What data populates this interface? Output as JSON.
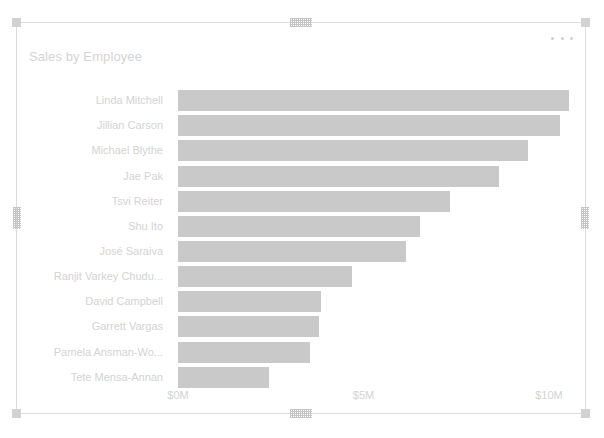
{
  "visual": {
    "title": "Sales by Employee",
    "more_options_label": "More options",
    "frame": {
      "border_color": "#dcdcdc",
      "handle_color": "#d2d2d2"
    }
  },
  "chart_data": {
    "type": "bar",
    "orientation": "horizontal",
    "title": "Sales by Employee",
    "xlabel": "",
    "ylabel": "",
    "grid": false,
    "legend": false,
    "xlim": [
      0,
      10.7
    ],
    "x_tick_values": [
      0,
      5,
      10
    ],
    "x_tick_labels": [
      "$0M",
      "$5M",
      "$10M"
    ],
    "bar_color": "#c9c9c9",
    "value_unit": "millions USD",
    "categories": [
      "Linda Mitchell",
      "Jillian Carson",
      "Michael Blythe",
      "Jae Pak",
      "Tsvi Reiter",
      "Shu Ito",
      "José Saraiva",
      "Ranjit Varkey Chudu...",
      "David Campbell",
      "Garrett Vargas",
      "Pamela Ansman-Wo...",
      "Tete Mensa-Annan"
    ],
    "values": [
      10.55,
      10.3,
      9.42,
      8.65,
      7.34,
      6.53,
      6.15,
      4.68,
      3.86,
      3.81,
      3.56,
      2.44
    ]
  }
}
